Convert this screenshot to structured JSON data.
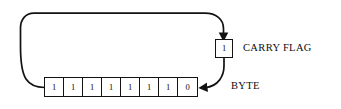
{
  "diagram": {
    "type": "rotate-through-carry",
    "background_color": "#ffffff",
    "stroke_color": "#121212",
    "byte": {
      "label": "BYTE",
      "bit_count": 8,
      "bits": [
        "1",
        "1",
        "1",
        "1",
        "1",
        "1",
        "1",
        "0"
      ],
      "value_binary": "11111110"
    },
    "carry_flag": {
      "label": "CARRY FLAG",
      "value": "1"
    },
    "arrows": [
      {
        "name": "byte-to-carry",
        "from": "byte-left-edge",
        "to": "carry-flag-top",
        "arrowhead": "at-carry-flag"
      },
      {
        "name": "carry-to-byte",
        "from": "carry-flag-bottom",
        "to": "byte-right-edge",
        "arrowhead": "at-byte"
      }
    ]
  }
}
